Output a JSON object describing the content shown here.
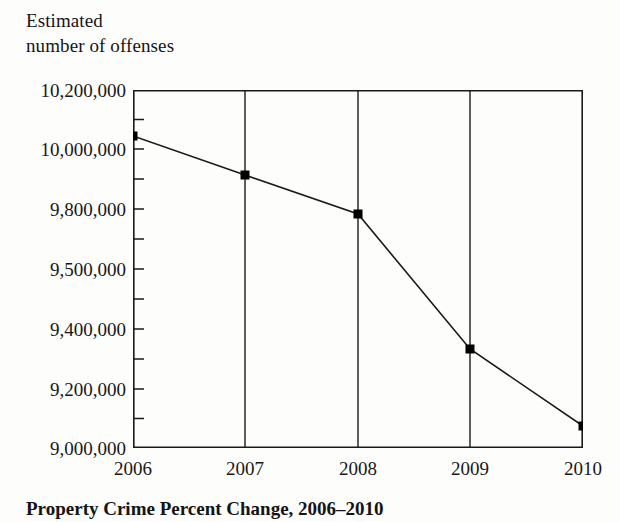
{
  "figure": {
    "axis_title": "Estimated\nnumber of offenses",
    "caption": "Property Crime Percent Change, 2006–2010"
  },
  "chart_data": {
    "type": "line",
    "title": "Property Crime Percent Change, 2006–2010",
    "ylabel": "Estimated number of offenses",
    "xlabel": "",
    "categories": [
      "2006",
      "2007",
      "2008",
      "2009",
      "2010"
    ],
    "values": [
      10020000,
      9870000,
      9760000,
      9350000,
      9090000
    ],
    "series": [
      {
        "name": "Estimated number of offenses",
        "values": [
          10020000,
          9870000,
          9760000,
          9350000,
          9090000
        ]
      }
    ],
    "y_tick_labels": [
      "10,200,000",
      "10,000,000",
      "9,800,000",
      "9,500,000",
      "9,400,000",
      "9,200,000",
      "9,000,000"
    ],
    "x_tick_labels": [
      "2006",
      "2007",
      "2008",
      "2009",
      "2010"
    ],
    "ylim": [
      9000000,
      10200000
    ],
    "grid": "vertical",
    "legend": "none",
    "marker": "filled-square",
    "line_color": "#1a1a1a",
    "marker_color": "#000000",
    "background_color": "#fdfdfb"
  },
  "y_axis": {
    "ticks": [
      {
        "label": "10,200,000",
        "y": 90
      },
      {
        "label": "10,000,000",
        "y": 149
      },
      {
        "label": "9,800,000",
        "y": 209
      },
      {
        "label": "9,500,000",
        "y": 269
      },
      {
        "label": "9,400,000",
        "y": 329
      },
      {
        "label": "9,200,000",
        "y": 389
      },
      {
        "label": "9,000,000",
        "y": 448
      }
    ]
  },
  "x_axis": {
    "ticks": [
      {
        "label": "2006",
        "x": 133
      },
      {
        "label": "2007",
        "x": 245
      },
      {
        "label": "2008",
        "x": 358
      },
      {
        "label": "2009",
        "x": 470
      },
      {
        "label": "2010",
        "x": 583
      }
    ]
  },
  "points": [
    {
      "year": "2006",
      "value": 10020000,
      "x": 133,
      "y": 136
    },
    {
      "year": "2007",
      "value": 9870000,
      "x": 245,
      "y": 175
    },
    {
      "year": "2008",
      "value": 9760000,
      "x": 358,
      "y": 214
    },
    {
      "year": "2009",
      "value": 9350000,
      "x": 470,
      "y": 349
    },
    {
      "year": "2010",
      "value": 9090000,
      "x": 583,
      "y": 426
    }
  ]
}
